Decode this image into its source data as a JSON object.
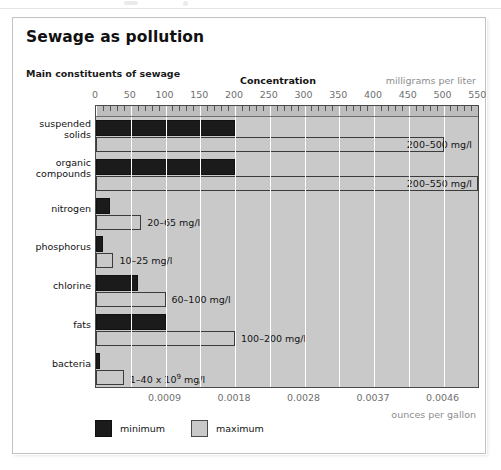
{
  "card": {
    "title": "Sewage as pollution",
    "subtitle": "Main constituents of sewage"
  },
  "axis_top": {
    "title": "Concentration",
    "unit": "milligrams per liter",
    "ticks": [
      "0",
      "50",
      "100",
      "150",
      "200",
      "250",
      "300",
      "350",
      "400",
      "450",
      "500",
      "550"
    ]
  },
  "axis_bottom": {
    "unit": "ounces per gallon",
    "ticks": [
      "0.0009",
      "0.0018",
      "0.0028",
      "0.0037",
      "0.0046"
    ]
  },
  "legend": {
    "items": [
      {
        "label": "minimum",
        "swatch": "dark-square-icon",
        "color": "#1b1b1b"
      },
      {
        "label": "maximum",
        "swatch": "light-square-icon",
        "color": "#c9c9c9"
      }
    ]
  },
  "rows": [
    {
      "label_line1": "suspended",
      "label_line2": "solids",
      "value_label": "200–500 mg/l"
    },
    {
      "label_line1": "organic",
      "label_line2": "compounds",
      "value_label": "200–550 mg/l"
    },
    {
      "label_line1": "nitrogen",
      "label_line2": "",
      "value_label": "20–65 mg/l"
    },
    {
      "label_line1": "phosphorus",
      "label_line2": "",
      "value_label": "10–25 mg/l"
    },
    {
      "label_line1": "chlorine",
      "label_line2": "",
      "value_label": "60–100 mg/l"
    },
    {
      "label_line1": "fats",
      "label_line2": "",
      "value_label": "100–200 mg/l"
    },
    {
      "label_line1": "bacteria",
      "label_line2": "",
      "value_label": "1–40 x 10⁹ mg/l"
    }
  ],
  "chart_data": {
    "type": "bar",
    "orientation": "horizontal",
    "title": "Main constituents of sewage",
    "xlabel": "Concentration",
    "xlabel_unit_primary": "milligrams per liter",
    "xlabel_unit_secondary": "ounces per gallon",
    "ylabel": "",
    "categories": [
      "suspended solids",
      "organic compounds",
      "nitrogen",
      "phosphorus",
      "chlorine",
      "fats",
      "bacteria"
    ],
    "series": [
      {
        "name": "minimum",
        "color": "#1b1b1b",
        "values": [
          200,
          200,
          20,
          10,
          60,
          100,
          1
        ]
      },
      {
        "name": "maximum",
        "color": "#c9c9c9",
        "values": [
          500,
          550,
          65,
          25,
          100,
          200,
          40
        ]
      }
    ],
    "data_labels": [
      "200–500 mg/l",
      "200–550 mg/l",
      "20–65 mg/l",
      "10–25 mg/l",
      "60–100 mg/l",
      "100–200 mg/l",
      "1–40 x 10⁹ mg/l"
    ],
    "xlim": [
      0,
      550
    ],
    "xticks": [
      0,
      50,
      100,
      150,
      200,
      250,
      300,
      350,
      400,
      450,
      500,
      550
    ],
    "xticks_secondary": [
      0.0009,
      0.0018,
      0.0028,
      0.0037,
      0.0046
    ],
    "xticks_secondary_positions_mgl": [
      100,
      200,
      300,
      400,
      500
    ],
    "grid": true,
    "legend_position": "bottom-left"
  }
}
